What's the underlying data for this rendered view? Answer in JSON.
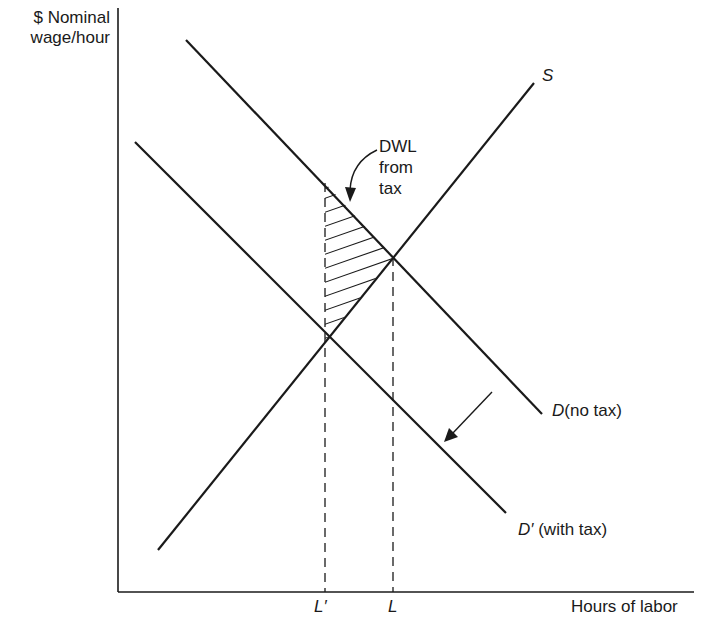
{
  "axes": {
    "y_label_line1": "$ Nominal",
    "y_label_line2": "wage/hour",
    "x_label": "Hours of labor"
  },
  "curves": {
    "supply": {
      "symbol": "S"
    },
    "demand": {
      "symbol": "D",
      "suffix": "(no tax)"
    },
    "demand_tax": {
      "symbol": "D′",
      "suffix": "(with tax)"
    }
  },
  "annotation": {
    "line1": "DWL",
    "line2": "from",
    "line3": "tax"
  },
  "ticks": {
    "l_prime": "L′",
    "l": "L"
  },
  "colors": {
    "ink": "#1a1a1a",
    "background": "#ffffff"
  }
}
